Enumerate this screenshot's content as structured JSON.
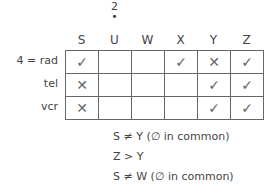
{
  "column_note": {
    "number": "2",
    "dot": "•",
    "column": "U"
  },
  "columns": [
    "S",
    "U",
    "W",
    "X",
    "Y",
    "Z"
  ],
  "rows": [
    {
      "label": "4 = rad",
      "cells": [
        "✓",
        "",
        "",
        "✓",
        "✕",
        "✓"
      ]
    },
    {
      "label": "tel",
      "cells": [
        "✕",
        "",
        "",
        "",
        "✓",
        "✓"
      ]
    },
    {
      "label": "vcr",
      "cells": [
        "✕",
        "",
        "",
        "",
        "✓",
        "✓"
      ]
    }
  ],
  "clues": [
    "S ≠ Y (∅ in common)",
    "Z > Y",
    "S ≠ W (∅ in common)"
  ]
}
